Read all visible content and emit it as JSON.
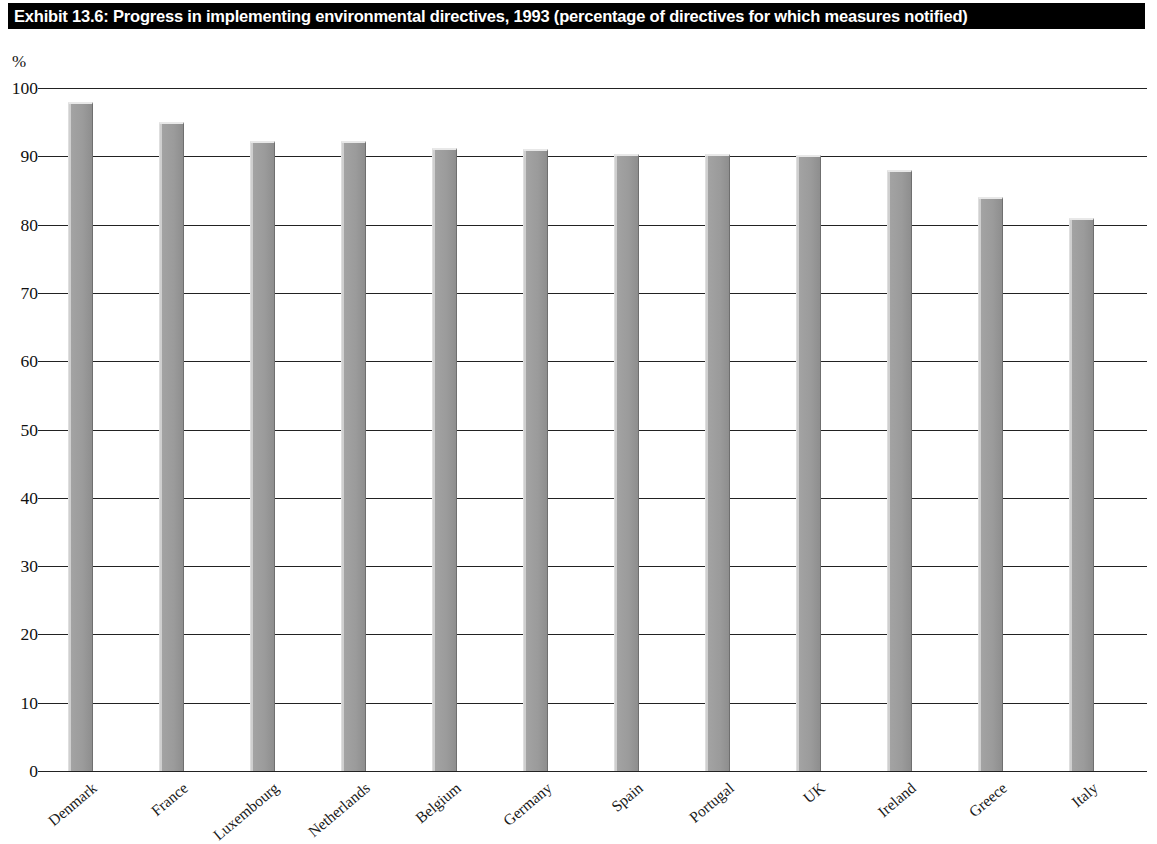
{
  "title": {
    "text": "Exhibit 13.6: Progress in implementing environmental directives, 1993 (percentage of directives for which measures notified)"
  },
  "axis": {
    "y_unit_label": "%",
    "y_ticks": [
      "100",
      "90",
      "80",
      "70",
      "60",
      "50",
      "40",
      "30",
      "20",
      "10",
      "0"
    ]
  },
  "colors": {
    "title_background": "#000000",
    "title_text": "#ffffff",
    "bar_fill": "#9b9b9b",
    "bar_highlight": "#dedede",
    "bar_shadow": "#6f6f6f",
    "gridline": "#222222",
    "page_background": "#ffffff"
  },
  "chart_data": {
    "type": "bar",
    "title": "Exhibit 13.6: Progress in implementing environmental directives, 1993 (percentage of directives for which measures notified)",
    "xlabel": "",
    "ylabel": "%",
    "ylim": [
      0,
      100
    ],
    "ytick_step": 10,
    "grid": true,
    "legend": false,
    "categories": [
      "Denmark",
      "France",
      "Luxembourg",
      "Netherlands",
      "Belgium",
      "Germany",
      "Spain",
      "Portugal",
      "UK",
      "Ireland",
      "Greece",
      "Italy"
    ],
    "values": [
      98,
      95,
      92.3,
      92.2,
      91.2,
      91.1,
      90.3,
      90.3,
      90.2,
      88,
      84,
      81
    ]
  }
}
